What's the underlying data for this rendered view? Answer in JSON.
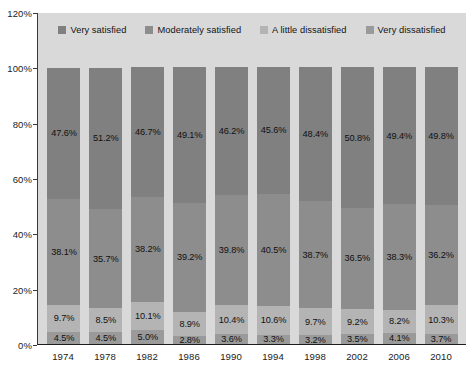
{
  "chart_data": {
    "type": "bar",
    "variant": "stacked-100",
    "title": "",
    "xlabel": "",
    "ylabel": "",
    "ylim": [
      0,
      120
    ],
    "ytick_step": 20,
    "ytick_labels": [
      "0%",
      "20%",
      "40%",
      "60%",
      "80%",
      "100%",
      "120%"
    ],
    "ytick_values": [
      0,
      20,
      40,
      60,
      80,
      100,
      120
    ],
    "grid": false,
    "legend_position": "top-center",
    "categories": [
      "1974",
      "1978",
      "1982",
      "1986",
      "1990",
      "1994",
      "1998",
      "2002",
      "2006",
      "2010"
    ],
    "series": [
      {
        "name": "Very satisfied",
        "color": "#808080",
        "values": [
          47.6,
          51.2,
          46.7,
          49.1,
          46.2,
          45.6,
          48.4,
          50.8,
          49.4,
          49.8
        ],
        "labels": [
          "47.6%",
          "51.2%",
          "46.7%",
          "49.1%",
          "46.2%",
          "45.6%",
          "48.4%",
          "50.8%",
          "49.4%",
          "49.8%"
        ]
      },
      {
        "name": "Moderately satisfied",
        "color": "#8d8d8d",
        "values": [
          38.1,
          35.7,
          38.2,
          39.2,
          39.8,
          40.5,
          38.7,
          36.5,
          38.3,
          36.2
        ],
        "labels": [
          "38.1%",
          "35.7%",
          "38.2%",
          "39.2%",
          "39.8%",
          "40.5%",
          "38.7%",
          "36.5%",
          "38.3%",
          "36.2%"
        ]
      },
      {
        "name": "A little dissatisfied",
        "color": "#b4b4b4",
        "values": [
          9.7,
          8.5,
          10.1,
          8.9,
          10.4,
          10.6,
          9.7,
          9.2,
          8.2,
          10.3
        ],
        "labels": [
          "9.7%",
          "8.5%",
          "10.1%",
          "8.9%",
          "10.4%",
          "10.6%",
          "9.7%",
          "9.2%",
          "8.2%",
          "10.3%"
        ]
      },
      {
        "name": "Very dissatisfied",
        "color": "#9a9a9a",
        "values": [
          4.5,
          4.5,
          5.0,
          2.8,
          3.6,
          3.3,
          3.2,
          3.5,
          4.1,
          3.7
        ],
        "labels": [
          "4.5%",
          "4.5%",
          "5.0%",
          "2.8%",
          "3.6%",
          "3.3%",
          "3.2%",
          "3.5%",
          "4.1%",
          "3.7%"
        ]
      }
    ]
  },
  "legend": {
    "items": [
      {
        "label": "Very satisfied",
        "color": "#808080"
      },
      {
        "label": "Moderately satisfied",
        "color": "#8d8d8d"
      },
      {
        "label": "A little dissatisfied",
        "color": "#b4b4b4"
      },
      {
        "label": "Very dissatisfied",
        "color": "#9a9a9a"
      }
    ]
  },
  "style": {
    "plot_background": "#d9d9d9",
    "page_background": "#ffffff",
    "axis_color": "#2a2a2a",
    "text_color": "#131313"
  }
}
